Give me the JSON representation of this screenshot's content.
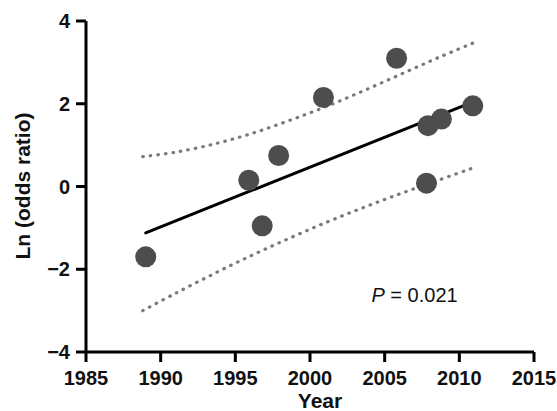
{
  "chart_data": {
    "type": "scatter",
    "title": "",
    "subtitle": "",
    "xlabel": "Year",
    "ylabel": "Ln (odds ratio)",
    "xlim": [
      1985,
      2015
    ],
    "ylim": [
      -4,
      4
    ],
    "xticks": [
      1985,
      1990,
      1995,
      2000,
      2005,
      2010,
      2015
    ],
    "xtick_labels": [
      "1985",
      "1990",
      "1995",
      "2000",
      "2005",
      "2010",
      "2015"
    ],
    "yticks": [
      -4,
      -2,
      0,
      2,
      4
    ],
    "ytick_labels": [
      "−4",
      "−2",
      "0",
      "2",
      "4"
    ],
    "grid": false,
    "legend": null,
    "marker": {
      "shape": "circle",
      "color": "#4d4d4d",
      "size_px": 21
    },
    "points": [
      {
        "x": 1989.0,
        "y": -1.7
      },
      {
        "x": 1995.9,
        "y": 0.15
      },
      {
        "x": 1996.8,
        "y": -0.95
      },
      {
        "x": 1997.9,
        "y": 0.75
      },
      {
        "x": 2000.9,
        "y": 2.15
      },
      {
        "x": 2005.8,
        "y": 3.1
      },
      {
        "x": 2007.8,
        "y": 0.08
      },
      {
        "x": 2007.9,
        "y": 1.47
      },
      {
        "x": 2008.8,
        "y": 1.63
      },
      {
        "x": 2010.9,
        "y": 1.95
      }
    ],
    "regression_line": {
      "name": "fitted regression line",
      "style": "solid",
      "color": "#000000",
      "width_px": 3,
      "x_start": 1989.0,
      "y_start": -1.12,
      "x_end": 2011.3,
      "y_end": 2.1
    },
    "confidence_bands": {
      "name": "95% confidence interval",
      "style": "dotted",
      "color": "#7a7a7a",
      "width_px": 3,
      "upper": [
        {
          "x": 1988.8,
          "y": 0.72
        },
        {
          "x": 1991.0,
          "y": 0.83
        },
        {
          "x": 1993.5,
          "y": 1.02
        },
        {
          "x": 1996.0,
          "y": 1.27
        },
        {
          "x": 1998.5,
          "y": 1.58
        },
        {
          "x": 2001.0,
          "y": 1.92
        },
        {
          "x": 2003.5,
          "y": 2.3
        },
        {
          "x": 2006.0,
          "y": 2.7
        },
        {
          "x": 2008.5,
          "y": 3.1
        },
        {
          "x": 2011.0,
          "y": 3.48
        }
      ],
      "lower": [
        {
          "x": 1988.8,
          "y": -3.0
        },
        {
          "x": 1991.0,
          "y": -2.58
        },
        {
          "x": 1993.5,
          "y": -2.12
        },
        {
          "x": 1996.0,
          "y": -1.68
        },
        {
          "x": 1998.5,
          "y": -1.27
        },
        {
          "x": 2001.0,
          "y": -0.88
        },
        {
          "x": 2003.5,
          "y": -0.52
        },
        {
          "x": 2006.0,
          "y": -0.18
        },
        {
          "x": 2008.5,
          "y": 0.14
        },
        {
          "x": 2011.0,
          "y": 0.46
        }
      ]
    },
    "annotations": [
      {
        "id": "p-value",
        "text_italic": "P",
        "text_rest": " = 0.021",
        "full_text": "P = 0.021",
        "x": 2007.0,
        "y": -2.78
      }
    ]
  },
  "axes": {
    "x_axis_title": "Year",
    "y_axis_title": "Ln (odds ratio)"
  },
  "colors": {
    "background": "#ffffff",
    "axis": "#000000",
    "marker": "#4d4d4d",
    "regression": "#000000",
    "confidence_band": "#7a7a7a",
    "text": "#111111"
  }
}
